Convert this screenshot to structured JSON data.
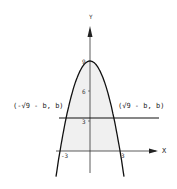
{
  "chart_data": {
    "type": "line",
    "title": "",
    "xlabel": "X",
    "ylabel": "Y",
    "xlim": [
      -3.4,
      6.8
    ],
    "ylim": [
      -2.2,
      12.5
    ],
    "grid": false,
    "series": [
      {
        "name": "parabola",
        "equation": "y = 9 - x^2",
        "x_range": [
          -3.4,
          3.4
        ]
      },
      {
        "name": "horizontal-line",
        "equation": "y = b",
        "b": 3.3,
        "x_range": [
          -3.1,
          6.9
        ]
      }
    ],
    "shaded_region": "area under parabola above x-axis",
    "y_ticks": [
      {
        "value": 9,
        "label": "9"
      },
      {
        "value": 6,
        "label": "6"
      },
      {
        "value": 3,
        "label": "3"
      }
    ],
    "x_ticks": [
      {
        "value": -3,
        "label": "-3"
      },
      {
        "value": 3,
        "label": "3"
      }
    ],
    "annotations": [
      {
        "text": "(-√9 - b, b)",
        "position": "left-intersection"
      },
      {
        "text": "(√9 - b, b)",
        "position": "right-intersection"
      }
    ]
  }
}
